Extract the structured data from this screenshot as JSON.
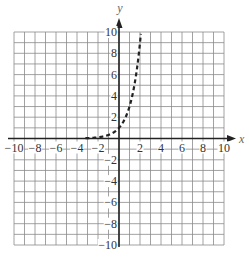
{
  "chart_data": {
    "type": "line",
    "title": "",
    "xlabel": "x",
    "ylabel": "y",
    "xlim": [
      -10,
      10
    ],
    "ylim": [
      -10,
      10
    ],
    "grid": true,
    "grid_step": 1,
    "x_ticks": [
      -10,
      -8,
      -6,
      -4,
      -2,
      2,
      4,
      6,
      8,
      10
    ],
    "y_ticks": [
      10,
      8,
      6,
      4,
      2,
      -2,
      -4,
      -6,
      -8,
      -10
    ],
    "series": [
      {
        "name": "y = 3^x",
        "style": "dashed",
        "color": "#222222",
        "x": [
          -3,
          -2,
          -1,
          0,
          0.5,
          1,
          1.5,
          2,
          2.1
        ],
        "y": [
          0.04,
          0.11,
          0.33,
          1,
          1.73,
          3,
          5.2,
          9,
          10
        ]
      }
    ]
  },
  "colors": {
    "grid": "#8a8a8a",
    "axis": "#222222",
    "curve": "#222222",
    "label": "#555555"
  }
}
